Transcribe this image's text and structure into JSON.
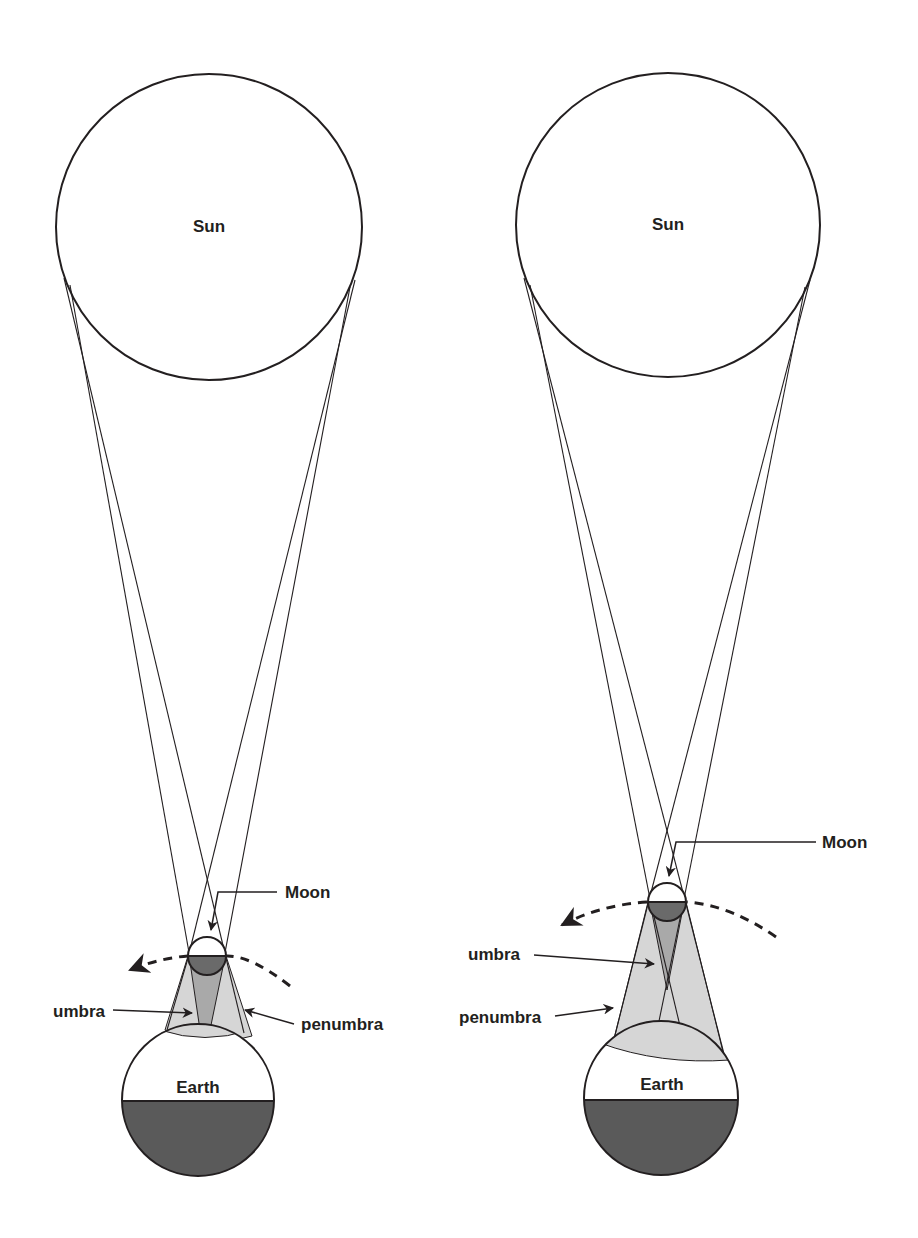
{
  "colors": {
    "stroke": "#231f20",
    "penumbra_fill": "#d6d6d6",
    "umbra_fill": "#a9a9a9",
    "night_fill": "#5a5a5a",
    "moon_dark_fill": "#6a6a6a",
    "background": "#ffffff"
  },
  "panels": [
    {
      "id": "left",
      "sun": {
        "label": "Sun",
        "cx": 209,
        "cy": 227,
        "r": 153
      },
      "moon": {
        "label": "Moon",
        "cx": 207,
        "cy": 956,
        "r": 19
      },
      "earth": {
        "label": "Earth",
        "cx": 198,
        "cy": 1100,
        "r": 76
      },
      "labels": {
        "umbra": "umbra",
        "penumbra": "penumbra"
      }
    },
    {
      "id": "right",
      "sun": {
        "label": "Sun",
        "cx": 668,
        "cy": 225,
        "r": 152
      },
      "moon": {
        "label": "Moon",
        "cx": 667,
        "cy": 902,
        "r": 19
      },
      "earth": {
        "label": "Earth",
        "cx": 661,
        "cy": 1098,
        "r": 77
      },
      "labels": {
        "umbra": "umbra",
        "penumbra": "penumbra"
      }
    }
  ]
}
